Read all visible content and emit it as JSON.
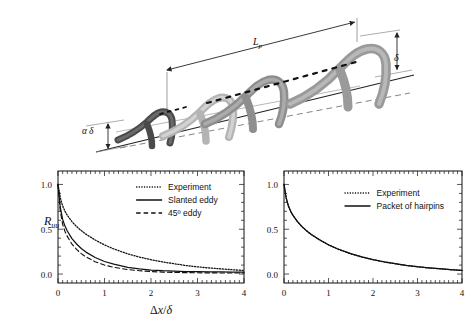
{
  "figure": {
    "schematic": {
      "name": "hairpin-vortex-packet-schematic",
      "labels": {
        "packet_length": "L",
        "packet_length_sub": "p",
        "delta": "δ",
        "alpha_delta_alpha": "α",
        "alpha_delta_delta": "δ"
      },
      "hairpins": [
        {
          "index": 1,
          "shade": "#4a4a4a",
          "scale": 0.58
        },
        {
          "index": 2,
          "shade": "#b4b4b4",
          "scale": 0.74
        },
        {
          "index": 3,
          "shade": "#8e8e8e",
          "scale": 0.86
        },
        {
          "index": 4,
          "shade": "#9a9a9a",
          "scale": 1.0
        }
      ]
    },
    "plots": [
      {
        "name": "left-plot",
        "ylabel": "R",
        "ylabel_sub": "uu",
        "xlabel_delta": "Δ",
        "xlabel_x": "x",
        "xlabel_slash": "/",
        "xlabel_d": "δ",
        "legend": [
          {
            "label": "Experiment",
            "style": "dotted"
          },
          {
            "label": "Slanted eddy",
            "style": "solid"
          },
          {
            "label": "45º eddy",
            "style": "dashed"
          }
        ]
      },
      {
        "name": "right-plot",
        "xlabel_delta": "Δ",
        "xlabel_x": "x",
        "xlabel_slash": "/",
        "xlabel_d": "δ",
        "legend": [
          {
            "label": "Experiment",
            "style": "dotted"
          },
          {
            "label": "Packet of hairpins",
            "style": "solid"
          }
        ]
      }
    ]
  },
  "chart_data": [
    {
      "type": "line",
      "title": "",
      "xlabel": "Δx/δ",
      "ylabel": "R_uu",
      "xlim": [
        0,
        4
      ],
      "ylim": [
        -0.1,
        1.15
      ],
      "xticks": [
        0,
        1,
        2,
        3,
        4
      ],
      "xticklabels": [
        "0",
        "1",
        "2",
        "3",
        "4"
      ],
      "yticks": [
        0.0,
        0.5,
        1.0
      ],
      "yticklabels": [
        "0.0",
        "0.5",
        "1.0"
      ],
      "grid": false,
      "legend_position": "upper-right",
      "x": [
        0,
        0.05,
        0.1,
        0.15,
        0.2,
        0.3,
        0.4,
        0.5,
        0.6,
        0.8,
        1.0,
        1.2,
        1.5,
        1.75,
        2.0,
        2.25,
        2.5,
        2.75,
        3.0,
        3.25,
        3.5,
        3.75,
        4.0
      ],
      "series": [
        {
          "name": "Experiment",
          "style": "dotted",
          "values": [
            1.0,
            0.85,
            0.76,
            0.7,
            0.655,
            0.585,
            0.53,
            0.485,
            0.445,
            0.38,
            0.325,
            0.28,
            0.225,
            0.19,
            0.16,
            0.135,
            0.115,
            0.095,
            0.08,
            0.068,
            0.058,
            0.048,
            0.04
          ]
        },
        {
          "name": "Slanted eddy",
          "style": "solid",
          "values": [
            1.0,
            0.74,
            0.61,
            0.535,
            0.48,
            0.395,
            0.335,
            0.285,
            0.245,
            0.185,
            0.14,
            0.11,
            0.075,
            0.058,
            0.045,
            0.037,
            0.032,
            0.028,
            0.026,
            0.024,
            0.023,
            0.022,
            0.021
          ]
        },
        {
          "name": "45º eddy",
          "style": "dashed",
          "values": [
            1.0,
            0.7,
            0.555,
            0.475,
            0.42,
            0.335,
            0.275,
            0.228,
            0.192,
            0.138,
            0.1,
            0.075,
            0.05,
            0.037,
            0.028,
            0.022,
            0.018,
            0.016,
            0.014,
            0.013,
            0.012,
            0.012,
            0.012
          ]
        }
      ]
    },
    {
      "type": "line",
      "title": "",
      "xlabel": "Δx/δ",
      "ylabel": "",
      "xlim": [
        0,
        4
      ],
      "ylim": [
        -0.1,
        1.15
      ],
      "xticks": [
        0,
        1,
        2,
        3,
        4
      ],
      "xticklabels": [
        "0",
        "1",
        "2",
        "3",
        "4"
      ],
      "yticks": [
        0.0,
        0.5,
        1.0
      ],
      "yticklabels": [
        "0.0",
        "0.5",
        "1.0"
      ],
      "grid": false,
      "legend_position": "upper-right",
      "x": [
        0,
        0.05,
        0.1,
        0.15,
        0.2,
        0.3,
        0.4,
        0.5,
        0.6,
        0.8,
        1.0,
        1.2,
        1.5,
        1.75,
        2.0,
        2.25,
        2.5,
        2.75,
        3.0,
        3.25,
        3.5,
        3.75,
        4.0
      ],
      "series": [
        {
          "name": "Experiment",
          "style": "dotted",
          "values": [
            1.0,
            0.85,
            0.76,
            0.7,
            0.655,
            0.585,
            0.53,
            0.485,
            0.445,
            0.38,
            0.325,
            0.28,
            0.225,
            0.19,
            0.16,
            0.135,
            0.115,
            0.095,
            0.08,
            0.068,
            0.058,
            0.048,
            0.04
          ]
        },
        {
          "name": "Packet of hairpins",
          "style": "solid",
          "values": [
            1.0,
            0.845,
            0.757,
            0.7,
            0.657,
            0.588,
            0.532,
            0.487,
            0.447,
            0.382,
            0.327,
            0.282,
            0.227,
            0.192,
            0.162,
            0.137,
            0.117,
            0.097,
            0.082,
            0.07,
            0.06,
            0.05,
            0.042
          ]
        }
      ]
    }
  ]
}
